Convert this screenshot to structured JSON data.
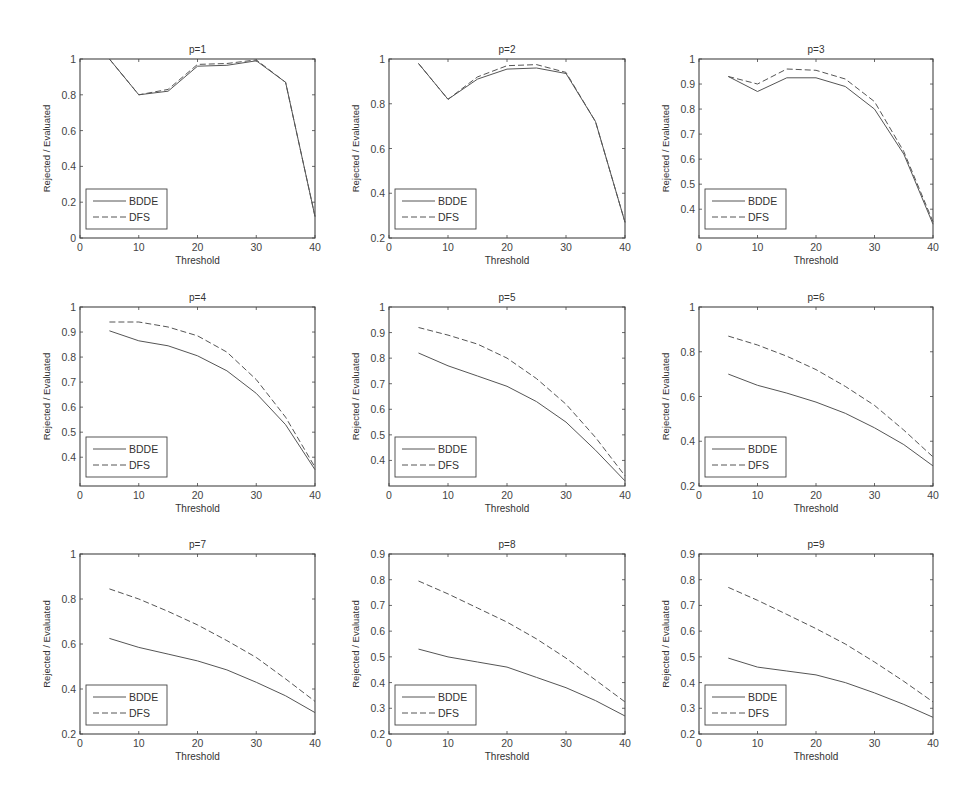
{
  "chart_data": [
    {
      "type": "line",
      "title": "p=1",
      "xlabel": "Threshold",
      "ylabel": "Rejected / Evaluated",
      "xlim": [
        0,
        40
      ],
      "ylim": [
        0,
        1
      ],
      "xticks": [
        "0",
        "10",
        "20",
        "30",
        "40"
      ],
      "yticks": [
        "0",
        "0.2",
        "0.4",
        "0.6",
        "0.8",
        "1"
      ],
      "x": [
        5,
        10,
        15,
        20,
        25,
        30,
        35,
        40
      ],
      "series": [
        {
          "name": "BDDE",
          "style": "solid",
          "values": [
            1.0,
            0.8,
            0.82,
            0.96,
            0.965,
            0.99,
            0.87,
            0.12
          ]
        },
        {
          "name": "DFS",
          "style": "dashed",
          "values": [
            1.0,
            0.8,
            0.83,
            0.97,
            0.975,
            0.995,
            0.87,
            0.12
          ]
        }
      ],
      "legend": "bottom-left",
      "grid": false
    },
    {
      "type": "line",
      "title": "p=2",
      "xlabel": "Threshold",
      "ylabel": "Rejected / Evaluated",
      "xlim": [
        0,
        40
      ],
      "ylim": [
        0.2,
        1
      ],
      "xticks": [
        "0",
        "10",
        "20",
        "30",
        "40"
      ],
      "yticks": [
        "0.2",
        "0.4",
        "0.6",
        "0.8",
        "1"
      ],
      "x": [
        5,
        10,
        15,
        20,
        25,
        30,
        35,
        40
      ],
      "series": [
        {
          "name": "BDDE",
          "style": "solid",
          "values": [
            0.98,
            0.82,
            0.91,
            0.955,
            0.96,
            0.935,
            0.72,
            0.27
          ]
        },
        {
          "name": "DFS",
          "style": "dashed",
          "values": [
            0.98,
            0.82,
            0.92,
            0.97,
            0.975,
            0.94,
            0.72,
            0.27
          ]
        }
      ],
      "legend": "bottom-left",
      "grid": false
    },
    {
      "type": "line",
      "title": "p=3",
      "xlabel": "Threshold",
      "ylabel": "Rejected / Evaluated",
      "xlim": [
        0,
        40
      ],
      "ylim": [
        0.285,
        1
      ],
      "xticks": [
        "0",
        "10",
        "20",
        "30",
        "40"
      ],
      "yticks": [
        "0.4",
        "0.5",
        "0.6",
        "0.7",
        "0.8",
        "0.9",
        "1"
      ],
      "x": [
        5,
        10,
        15,
        20,
        25,
        30,
        35,
        40
      ],
      "series": [
        {
          "name": "BDDE",
          "style": "solid",
          "values": [
            0.93,
            0.87,
            0.925,
            0.925,
            0.89,
            0.8,
            0.62,
            0.34
          ]
        },
        {
          "name": "DFS",
          "style": "dashed",
          "values": [
            0.93,
            0.9,
            0.96,
            0.955,
            0.92,
            0.83,
            0.63,
            0.35
          ]
        }
      ],
      "legend": "bottom-left",
      "grid": false
    },
    {
      "type": "line",
      "title": "p=4",
      "xlabel": "Threshold",
      "ylabel": "Rejected / Evaluated",
      "xlim": [
        0,
        40
      ],
      "ylim": [
        0.285,
        1
      ],
      "xticks": [
        "0",
        "10",
        "20",
        "30",
        "40"
      ],
      "yticks": [
        "0.4",
        "0.5",
        "0.6",
        "0.7",
        "0.8",
        "0.9",
        "1"
      ],
      "x": [
        5,
        10,
        15,
        20,
        25,
        30,
        35,
        40
      ],
      "series": [
        {
          "name": "BDDE",
          "style": "solid",
          "values": [
            0.905,
            0.865,
            0.845,
            0.805,
            0.745,
            0.655,
            0.53,
            0.35
          ]
        },
        {
          "name": "DFS",
          "style": "dashed",
          "values": [
            0.94,
            0.94,
            0.92,
            0.885,
            0.82,
            0.71,
            0.56,
            0.36
          ]
        }
      ],
      "legend": "bottom-left",
      "grid": false
    },
    {
      "type": "line",
      "title": "p=5",
      "xlabel": "Threshold",
      "ylabel": "Rejected / Evaluated",
      "xlim": [
        0,
        40
      ],
      "ylim": [
        0.3,
        1
      ],
      "xticks": [
        "0",
        "10",
        "20",
        "30",
        "40"
      ],
      "yticks": [
        "0.4",
        "0.5",
        "0.6",
        "0.7",
        "0.8",
        "0.9",
        "1"
      ],
      "x": [
        5,
        10,
        15,
        20,
        25,
        30,
        35,
        40
      ],
      "series": [
        {
          "name": "BDDE",
          "style": "solid",
          "values": [
            0.82,
            0.77,
            0.73,
            0.69,
            0.63,
            0.55,
            0.44,
            0.32
          ]
        },
        {
          "name": "DFS",
          "style": "dashed",
          "values": [
            0.92,
            0.89,
            0.855,
            0.8,
            0.72,
            0.62,
            0.49,
            0.34
          ]
        }
      ],
      "legend": "bottom-left",
      "grid": false
    },
    {
      "type": "line",
      "title": "p=6",
      "xlabel": "Threshold",
      "ylabel": "Rejected / Evaluated",
      "xlim": [
        0,
        40
      ],
      "ylim": [
        0.2,
        1
      ],
      "xticks": [
        "0",
        "10",
        "20",
        "30",
        "40"
      ],
      "yticks": [
        "0.2",
        "0.4",
        "0.6",
        "0.8",
        "1"
      ],
      "x": [
        5,
        10,
        15,
        20,
        25,
        30,
        35,
        40
      ],
      "series": [
        {
          "name": "BDDE",
          "style": "solid",
          "values": [
            0.7,
            0.65,
            0.615,
            0.575,
            0.525,
            0.46,
            0.385,
            0.29
          ]
        },
        {
          "name": "DFS",
          "style": "dashed",
          "values": [
            0.87,
            0.83,
            0.78,
            0.72,
            0.645,
            0.56,
            0.45,
            0.33
          ]
        }
      ],
      "legend": "bottom-left",
      "grid": false
    },
    {
      "type": "line",
      "title": "p=7",
      "xlabel": "Threshold",
      "ylabel": "Rejected / Evaluated",
      "xlim": [
        0,
        40
      ],
      "ylim": [
        0.2,
        1
      ],
      "xticks": [
        "0",
        "10",
        "20",
        "30",
        "40"
      ],
      "yticks": [
        "0.2",
        "0.4",
        "0.6",
        "0.8",
        "1"
      ],
      "x": [
        5,
        10,
        15,
        20,
        25,
        30,
        35,
        40
      ],
      "series": [
        {
          "name": "BDDE",
          "style": "solid",
          "values": [
            0.625,
            0.585,
            0.555,
            0.525,
            0.485,
            0.43,
            0.37,
            0.295
          ]
        },
        {
          "name": "DFS",
          "style": "dashed",
          "values": [
            0.845,
            0.8,
            0.745,
            0.685,
            0.615,
            0.54,
            0.445,
            0.345
          ]
        }
      ],
      "legend": "bottom-left",
      "grid": false
    },
    {
      "type": "line",
      "title": "p=8",
      "xlabel": "Threshold",
      "ylabel": "Rejected / Evaluated",
      "xlim": [
        0,
        40
      ],
      "ylim": [
        0.2,
        0.9
      ],
      "xticks": [
        "0",
        "10",
        "20",
        "30",
        "40"
      ],
      "yticks": [
        "0.2",
        "0.3",
        "0.4",
        "0.5",
        "0.6",
        "0.7",
        "0.8",
        "0.9"
      ],
      "x": [
        5,
        10,
        15,
        20,
        25,
        30,
        35,
        40
      ],
      "series": [
        {
          "name": "BDDE",
          "style": "solid",
          "values": [
            0.53,
            0.5,
            0.48,
            0.46,
            0.42,
            0.38,
            0.33,
            0.27
          ]
        },
        {
          "name": "DFS",
          "style": "dashed",
          "values": [
            0.795,
            0.745,
            0.69,
            0.635,
            0.57,
            0.495,
            0.41,
            0.325
          ]
        }
      ],
      "legend": "bottom-left",
      "grid": false
    },
    {
      "type": "line",
      "title": "p=9",
      "xlabel": "Threshold",
      "ylabel": "Rejected / Evaluated",
      "xlim": [
        0,
        40
      ],
      "ylim": [
        0.2,
        0.9
      ],
      "xticks": [
        "0",
        "10",
        "20",
        "30",
        "40"
      ],
      "yticks": [
        "0.2",
        "0.3",
        "0.4",
        "0.5",
        "0.6",
        "0.7",
        "0.8",
        "0.9"
      ],
      "x": [
        5,
        10,
        15,
        20,
        25,
        30,
        35,
        40
      ],
      "series": [
        {
          "name": "BDDE",
          "style": "solid",
          "values": [
            0.495,
            0.46,
            0.445,
            0.43,
            0.4,
            0.36,
            0.315,
            0.265
          ]
        },
        {
          "name": "DFS",
          "style": "dashed",
          "values": [
            0.77,
            0.72,
            0.665,
            0.61,
            0.55,
            0.48,
            0.405,
            0.325
          ]
        }
      ],
      "legend": "bottom-left",
      "grid": false
    }
  ]
}
